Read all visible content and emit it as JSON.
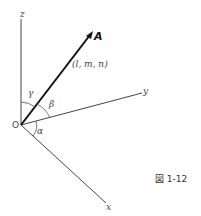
{
  "figure": {
    "caption": "図 1-12",
    "colors": {
      "axis": "#444444",
      "vector": "#111111",
      "text": "#444444",
      "background": "#ffffff"
    }
  },
  "axes": {
    "z_label": "z",
    "y_label": "y",
    "x_label": "x",
    "origin_label": "O"
  },
  "vector": {
    "label": "A",
    "direction_cosines": "(l, m, n)"
  },
  "angles": {
    "alpha": "α",
    "beta": "β",
    "gamma": "γ"
  }
}
